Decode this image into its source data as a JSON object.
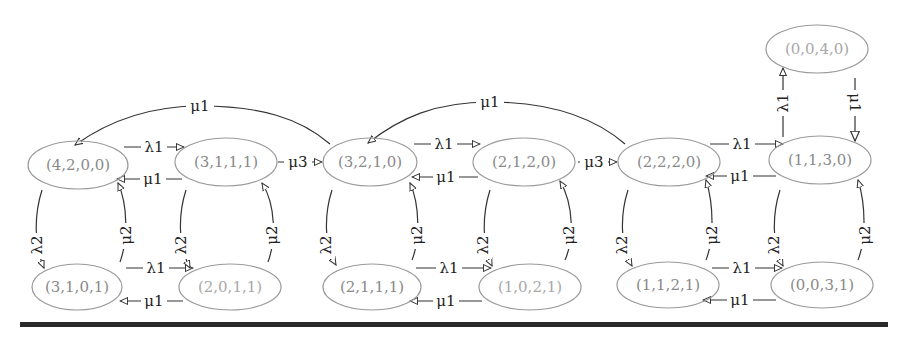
{
  "diagram": {
    "type": "state-transition-diagram",
    "nodes": [
      {
        "id": "n4200",
        "label": "(4,2,0,0)"
      },
      {
        "id": "n3111",
        "label": "(3,1,1,1)"
      },
      {
        "id": "n3101",
        "label": "(3,1,0,1)"
      },
      {
        "id": "n2011",
        "label": "(2,0,1,1)"
      },
      {
        "id": "n3210",
        "label": "(3,2,1,0)"
      },
      {
        "id": "n2120",
        "label": "(2,1,2,0)"
      },
      {
        "id": "n2111",
        "label": "(2,1,1,1)"
      },
      {
        "id": "n1021",
        "label": "(1,0,2,1)"
      },
      {
        "id": "n2220",
        "label": "(2,2,2,0)"
      },
      {
        "id": "n1130",
        "label": "(1,1,3,0)"
      },
      {
        "id": "n1121",
        "label": "(1,1,2,1)"
      },
      {
        "id": "n0031",
        "label": "(0,0,3,1)"
      },
      {
        "id": "n0040",
        "label": "(0,0,4,0)"
      }
    ],
    "edge_labels": {
      "lambda1": "λ1",
      "lambda2": "λ2",
      "mu1": "μ1",
      "mu2": "μ2",
      "mu3": "μ3"
    },
    "edges": [
      {
        "from": "(4,2,0,0)",
        "to": "(3,1,1,1)",
        "label": "λ1"
      },
      {
        "from": "(3,1,1,1)",
        "to": "(4,2,0,0)",
        "label": "μ1"
      },
      {
        "from": "(4,2,0,0)",
        "to": "(3,1,0,1)",
        "label": "λ2"
      },
      {
        "from": "(3,1,0,1)",
        "to": "(4,2,0,0)",
        "label": "μ2"
      },
      {
        "from": "(3,1,1,1)",
        "to": "(2,0,1,1)",
        "label": "λ2"
      },
      {
        "from": "(2,0,1,1)",
        "to": "(3,1,1,1)",
        "label": "μ2"
      },
      {
        "from": "(3,1,0,1)",
        "to": "(2,0,1,1)",
        "label": "λ1"
      },
      {
        "from": "(2,0,1,1)",
        "to": "(3,1,0,1)",
        "label": "μ1"
      },
      {
        "from": "(3,1,1,1)",
        "to": "(3,2,1,0)",
        "label": "μ3"
      },
      {
        "from": "(3,2,1,0)",
        "to": "(4,2,0,0)",
        "label": "μ1"
      },
      {
        "from": "(3,2,1,0)",
        "to": "(2,1,2,0)",
        "label": "λ1"
      },
      {
        "from": "(2,1,2,0)",
        "to": "(3,2,1,0)",
        "label": "μ1"
      },
      {
        "from": "(3,2,1,0)",
        "to": "(2,1,1,1)",
        "label": "λ2"
      },
      {
        "from": "(2,1,1,1)",
        "to": "(3,2,1,0)",
        "label": "μ2"
      },
      {
        "from": "(2,1,2,0)",
        "to": "(1,0,2,1)",
        "label": "λ2"
      },
      {
        "from": "(1,0,2,1)",
        "to": "(2,1,2,0)",
        "label": "μ2"
      },
      {
        "from": "(2,1,1,1)",
        "to": "(1,0,2,1)",
        "label": "λ1"
      },
      {
        "from": "(1,0,2,1)",
        "to": "(2,1,1,1)",
        "label": "μ1"
      },
      {
        "from": "(2,1,2,0)",
        "to": "(2,2,2,0)",
        "label": "μ3"
      },
      {
        "from": "(2,2,2,0)",
        "to": "(3,2,1,0)",
        "label": "μ1"
      },
      {
        "from": "(2,2,2,0)",
        "to": "(1,1,3,0)",
        "label": "λ1"
      },
      {
        "from": "(1,1,3,0)",
        "to": "(2,2,2,0)",
        "label": "μ1"
      },
      {
        "from": "(2,2,2,0)",
        "to": "(1,1,2,1)",
        "label": "λ2"
      },
      {
        "from": "(1,1,2,1)",
        "to": "(2,2,2,0)",
        "label": "μ2"
      },
      {
        "from": "(1,1,3,0)",
        "to": "(0,0,3,1)",
        "label": "λ2"
      },
      {
        "from": "(0,0,3,1)",
        "to": "(1,1,3,0)",
        "label": "μ2"
      },
      {
        "from": "(1,1,2,1)",
        "to": "(0,0,3,1)",
        "label": "λ1"
      },
      {
        "from": "(0,0,3,1)",
        "to": "(1,1,2,1)",
        "label": "μ1"
      },
      {
        "from": "(1,1,3,0)",
        "to": "(0,0,4,0)",
        "label": "λ1"
      },
      {
        "from": "(0,0,4,0)",
        "to": "(1,1,3,0)",
        "label": "μ1"
      }
    ]
  },
  "colors": {
    "node_stroke": "#9a9a9a",
    "node_text": "#8a8a8a",
    "edge": "#333333",
    "rule": "#2a2a2a"
  }
}
